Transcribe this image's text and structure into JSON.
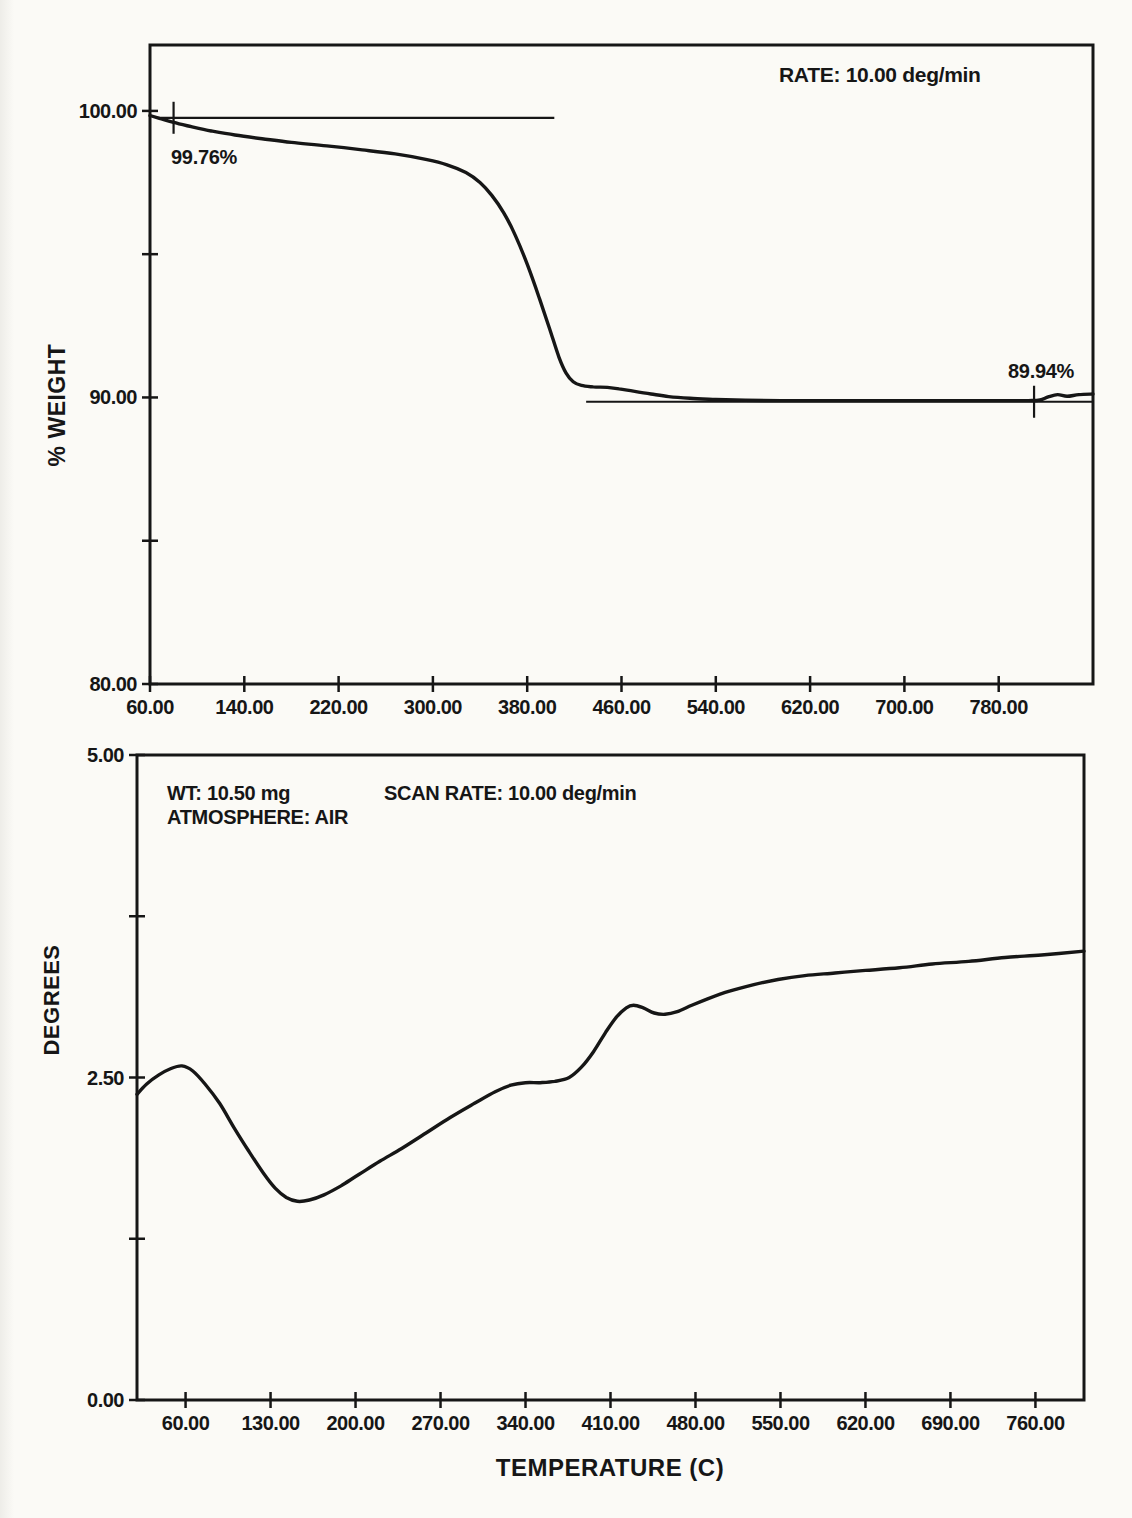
{
  "page": {
    "background": "#fbfaf6",
    "ink": "#161616",
    "width": 1132,
    "height": 1518
  },
  "chart_data": [
    {
      "id": "tga-weight-thermogram",
      "type": "line",
      "panel": "top",
      "ylabel": "% WEIGHT",
      "xlabel": "",
      "annotations": {
        "rate": "RATE: 10.00 deg/min"
      },
      "xlim": [
        60,
        860
      ],
      "ylim": [
        80,
        102.3
      ],
      "grid": false,
      "legend": "none",
      "x_ticks": [
        {
          "value": 60,
          "label": "60.00"
        },
        {
          "value": 140,
          "label": "140.00"
        },
        {
          "value": 220,
          "label": "220.00"
        },
        {
          "value": 300,
          "label": "300.00"
        },
        {
          "value": 380,
          "label": "380.00"
        },
        {
          "value": 460,
          "label": "460.00"
        },
        {
          "value": 540,
          "label": "540.00"
        },
        {
          "value": 620,
          "label": "620.00"
        },
        {
          "value": 700,
          "label": "700.00"
        },
        {
          "value": 780,
          "label": "780.00"
        }
      ],
      "y_ticks": [
        {
          "value": 100,
          "label": "100.00"
        },
        {
          "value": 95,
          "label": ""
        },
        {
          "value": 90,
          "label": "90.00"
        },
        {
          "value": 85,
          "label": ""
        },
        {
          "value": 80,
          "label": "80.00"
        }
      ],
      "ref_lines": [
        {
          "label": "99.76%",
          "value": 99.76,
          "x_start": 66,
          "x_end": 403,
          "marker_x": 80
        },
        {
          "label": "89.94%",
          "value": 89.85,
          "x_start": 430,
          "x_end": 860,
          "marker_x": 810
        }
      ],
      "series": [
        {
          "name": "weight_percent_vs_temperature",
          "points": [
            [
              60,
              99.84
            ],
            [
              68,
              99.74
            ],
            [
              80,
              99.6
            ],
            [
              95,
              99.45
            ],
            [
              112,
              99.3
            ],
            [
              132,
              99.16
            ],
            [
              155,
              99.03
            ],
            [
              180,
              98.9
            ],
            [
              210,
              98.78
            ],
            [
              240,
              98.64
            ],
            [
              268,
              98.5
            ],
            [
              295,
              98.3
            ],
            [
              312,
              98.12
            ],
            [
              328,
              97.85
            ],
            [
              340,
              97.5
            ],
            [
              350,
              97.05
            ],
            [
              360,
              96.45
            ],
            [
              370,
              95.65
            ],
            [
              380,
              94.65
            ],
            [
              390,
              93.5
            ],
            [
              399,
              92.4
            ],
            [
              407,
              91.4
            ],
            [
              413,
              90.85
            ],
            [
              419,
              90.55
            ],
            [
              426,
              90.42
            ],
            [
              436,
              90.37
            ],
            [
              448,
              90.35
            ],
            [
              458,
              90.3
            ],
            [
              470,
              90.22
            ],
            [
              485,
              90.12
            ],
            [
              500,
              90.03
            ],
            [
              518,
              89.97
            ],
            [
              540,
              89.93
            ],
            [
              565,
              89.9
            ],
            [
              595,
              89.89
            ],
            [
              630,
              89.89
            ],
            [
              670,
              89.89
            ],
            [
              710,
              89.89
            ],
            [
              750,
              89.89
            ],
            [
              785,
              89.89
            ],
            [
              805,
              89.89
            ],
            [
              815,
              89.91
            ],
            [
              822,
              90.02
            ],
            [
              830,
              90.1
            ],
            [
              838,
              90.04
            ],
            [
              848,
              90.1
            ],
            [
              860,
              90.12
            ]
          ]
        }
      ],
      "layout": {
        "left": 150,
        "top": 45,
        "right": 1093,
        "bottom": 684
      }
    },
    {
      "id": "dta-degrees-trace",
      "type": "line",
      "panel": "bottom",
      "ylabel": "DEGREES",
      "xlabel": "TEMPERATURE (C)",
      "annotations": {
        "wt": "WT: 10.50 mg",
        "atmosphere": "ATMOSPHERE: AIR",
        "scan_rate": "SCAN RATE: 10.00 deg/min"
      },
      "xlim": [
        20,
        800
      ],
      "ylim": [
        0,
        5
      ],
      "grid": false,
      "legend": "none",
      "x_ticks": [
        {
          "value": 60,
          "label": "60.00"
        },
        {
          "value": 130,
          "label": "130.00"
        },
        {
          "value": 200,
          "label": "200.00"
        },
        {
          "value": 270,
          "label": "270.00"
        },
        {
          "value": 340,
          "label": "340.00"
        },
        {
          "value": 410,
          "label": "410.00"
        },
        {
          "value": 480,
          "label": "480.00"
        },
        {
          "value": 550,
          "label": "550.00"
        },
        {
          "value": 620,
          "label": "620.00"
        },
        {
          "value": 690,
          "label": "690.00"
        },
        {
          "value": 760,
          "label": "760.00"
        }
      ],
      "y_ticks": [
        {
          "value": 5,
          "label": "5.00"
        },
        {
          "value": 3.75,
          "label": ""
        },
        {
          "value": 2.5,
          "label": "2.50"
        },
        {
          "value": 1.25,
          "label": ""
        },
        {
          "value": 0,
          "label": "0.00"
        }
      ],
      "ref_lines": [],
      "series": [
        {
          "name": "temperature_differential_vs_temperature",
          "points": [
            [
              20,
              2.37
            ],
            [
              28,
              2.45
            ],
            [
              38,
              2.52
            ],
            [
              48,
              2.57
            ],
            [
              57,
              2.59
            ],
            [
              66,
              2.55
            ],
            [
              76,
              2.45
            ],
            [
              88,
              2.3
            ],
            [
              100,
              2.11
            ],
            [
              112,
              1.93
            ],
            [
              124,
              1.76
            ],
            [
              134,
              1.64
            ],
            [
              143,
              1.57
            ],
            [
              152,
              1.54
            ],
            [
              162,
              1.55
            ],
            [
              174,
              1.59
            ],
            [
              188,
              1.66
            ],
            [
              203,
              1.75
            ],
            [
              220,
              1.85
            ],
            [
              238,
              1.95
            ],
            [
              258,
              2.07
            ],
            [
              278,
              2.19
            ],
            [
              298,
              2.3
            ],
            [
              315,
              2.39
            ],
            [
              328,
              2.44
            ],
            [
              340,
              2.46
            ],
            [
              352,
              2.46
            ],
            [
              364,
              2.47
            ],
            [
              376,
              2.5
            ],
            [
              386,
              2.58
            ],
            [
              396,
              2.7
            ],
            [
              406,
              2.85
            ],
            [
              415,
              2.97
            ],
            [
              423,
              3.04
            ],
            [
              429,
              3.06
            ],
            [
              437,
              3.04
            ],
            [
              446,
              3.0
            ],
            [
              455,
              2.99
            ],
            [
              465,
              3.01
            ],
            [
              477,
              3.06
            ],
            [
              490,
              3.11
            ],
            [
              508,
              3.17
            ],
            [
              528,
              3.22
            ],
            [
              548,
              3.26
            ],
            [
              570,
              3.29
            ],
            [
              595,
              3.31
            ],
            [
              620,
              3.33
            ],
            [
              648,
              3.35
            ],
            [
              675,
              3.38
            ],
            [
              705,
              3.4
            ],
            [
              735,
              3.43
            ],
            [
              765,
              3.45
            ],
            [
              800,
              3.48
            ]
          ]
        }
      ],
      "layout": {
        "left": 137,
        "top": 755,
        "right": 1084,
        "bottom": 1400
      }
    }
  ]
}
